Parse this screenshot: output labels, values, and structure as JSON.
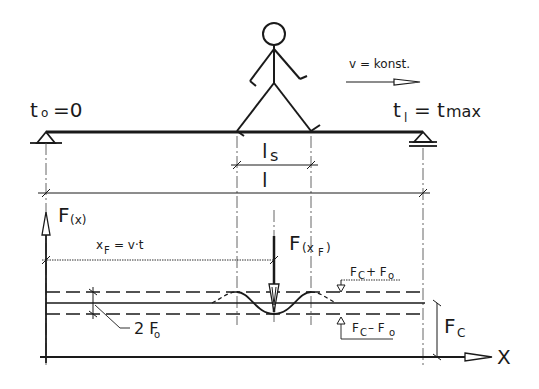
{
  "diagram": {
    "labels": {
      "start_time": "t",
      "start_time_sub": "o",
      "start_time_value": "=0",
      "end_time": "t",
      "end_time_sub": "l",
      "end_time_value": "= t",
      "end_time_value_sub": "max",
      "velocity": "v = konst.",
      "step_length": "l",
      "step_length_sub": "s",
      "span_length": "l",
      "force_axis": "F",
      "force_axis_arg": "(x)",
      "position_formula_x": "x",
      "position_formula_sub": "F",
      "position_formula_rest": "= v·t",
      "force_at_position": "F",
      "force_at_position_arg": "(x",
      "force_at_position_arg_sub": "F",
      "force_at_position_close": ")",
      "upper_bound": "F",
      "upper_bound_sub": "C",
      "upper_bound_plus": "+ F",
      "upper_bound_plus_sub": "o",
      "lower_bound": "F",
      "lower_bound_sub": "C",
      "lower_bound_minus": "– F",
      "lower_bound_minus_sub": "o",
      "amplitude": "2 F",
      "amplitude_sub": "o",
      "constant_force": "F",
      "constant_force_sub": "C",
      "x_axis": "X"
    },
    "colors": {
      "ink": "#1a1a1a",
      "background": "#ffffff"
    }
  }
}
